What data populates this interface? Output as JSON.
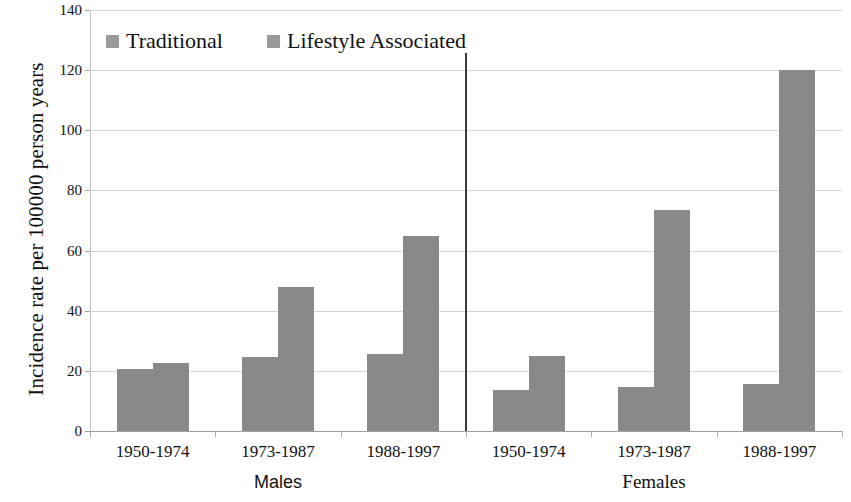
{
  "chart_data": {
    "type": "bar",
    "title": "",
    "xlabel": "",
    "ylabel": "Incidence rate per 100000 person years",
    "ylim": [
      0,
      140
    ],
    "ytick_values": [
      140,
      120,
      100,
      80,
      60,
      40,
      20,
      0
    ],
    "ytick_labels": [
      "140",
      "120",
      "100",
      "80",
      "60",
      "40",
      "20",
      "0"
    ],
    "grid": true,
    "legend_position": "top-left",
    "bar_color": "#898989",
    "legend_swatch_color": "#9a9a9a",
    "gridline_color": "#d0d5dc",
    "divider_color": "#3a3a3a",
    "categories": [
      "1950-1974",
      "1973-1987",
      "1988-1997",
      "1950-1974",
      "1973-1987",
      "1988-1997"
    ],
    "groups": [
      {
        "name": "Males",
        "categories": [
          "1950-1974",
          "1973-1987",
          "1988-1997"
        ]
      },
      {
        "name": "Females",
        "categories": [
          "1950-1974",
          "1973-1987",
          "1988-1997"
        ]
      }
    ],
    "series": [
      {
        "name": "Traditional",
        "values": [
          20.5,
          24.5,
          25.5,
          13.5,
          14.5,
          15.5
        ]
      },
      {
        "name": "Lifestyle Associated",
        "values": [
          22.5,
          48,
          65,
          25,
          73.5,
          120
        ]
      }
    ],
    "points": [
      {
        "group": "Males",
        "period": "1950-1974",
        "Traditional": 20.5,
        "Lifestyle Associated": 22.5
      },
      {
        "group": "Males",
        "period": "1973-1987",
        "Traditional": 24.5,
        "Lifestyle Associated": 48
      },
      {
        "group": "Males",
        "period": "1988-1997",
        "Traditional": 25.5,
        "Lifestyle Associated": 65
      },
      {
        "group": "Females",
        "period": "1950-1974",
        "Traditional": 13.5,
        "Lifestyle Associated": 25
      },
      {
        "group": "Females",
        "period": "1973-1987",
        "Traditional": 14.5,
        "Lifestyle Associated": 73.5
      },
      {
        "group": "Females",
        "period": "1988-1997",
        "Traditional": 15.5,
        "Lifestyle Associated": 120
      }
    ],
    "legend": [
      {
        "label": "Traditional"
      },
      {
        "label": "Lifestyle Associated"
      }
    ]
  }
}
